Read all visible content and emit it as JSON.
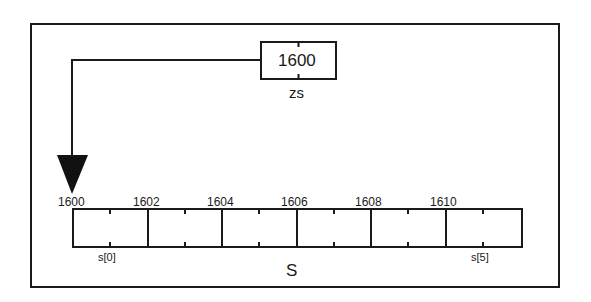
{
  "diagram": {
    "pointer": {
      "name": "zs",
      "value": "1600"
    },
    "array": {
      "name": "S",
      "addresses": [
        "1600",
        "1602",
        "1604",
        "1606",
        "1608",
        "1610"
      ],
      "first_index_label": "s[0]",
      "last_index_label": "s[5]",
      "cell_count": 6
    },
    "colors": {
      "line": "#1a1a1a",
      "background": "#ffffff"
    }
  }
}
